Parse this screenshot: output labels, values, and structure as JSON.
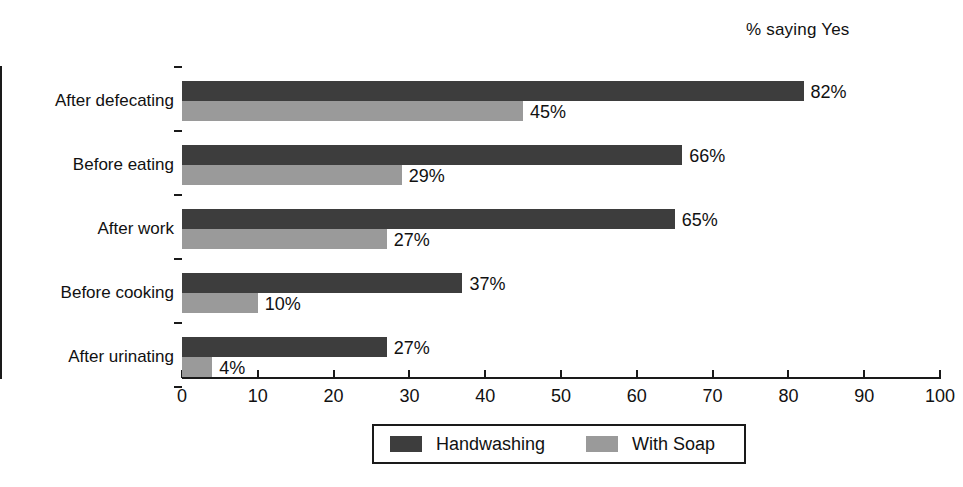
{
  "chart_data": {
    "type": "bar",
    "orientation": "horizontal",
    "title": "",
    "axis_note": "% saying Yes",
    "xlabel": "",
    "ylabel": "",
    "xlim": [
      0,
      100
    ],
    "xticks": [
      0,
      10,
      20,
      30,
      40,
      50,
      60,
      70,
      80,
      90,
      100
    ],
    "xtick_labels": [
      "0",
      "10",
      "20",
      "30",
      "40",
      "50",
      "60",
      "70",
      "80",
      "90",
      "100"
    ],
    "grid": false,
    "legend_position": "bottom",
    "categories": [
      "After defecating",
      "Before eating",
      "After work",
      "Before cooking",
      "After urinating"
    ],
    "series": [
      {
        "name": "Handwashing",
        "color": "#3d3d3d",
        "values": [
          82,
          66,
          65,
          37,
          27
        ],
        "value_labels": [
          "82%",
          "66%",
          "65%",
          "37%",
          "27%"
        ]
      },
      {
        "name": "With Soap",
        "color": "#9a9a9a",
        "values": [
          45,
          29,
          27,
          10,
          4
        ],
        "value_labels": [
          "45%",
          "29%",
          "27%",
          "10%",
          "4%"
        ]
      }
    ]
  },
  "legend": {
    "entries": [
      {
        "label": "Handwashing",
        "color": "#3d3d3d"
      },
      {
        "label": "With Soap",
        "color": "#9a9a9a"
      }
    ]
  }
}
